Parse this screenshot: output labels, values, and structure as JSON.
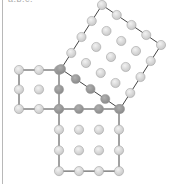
{
  "caption": "a:b:c:",
  "colors": {
    "dot_light": "#c8c8c8",
    "dot_dark": "#8a8a8a",
    "edge": "#444444",
    "dot_stroke": "#999999"
  },
  "diagram": {
    "squares": [
      {
        "name": "small-square",
        "side_dots": 3,
        "origin": [
          19,
          70
        ],
        "u": [
          20,
          0
        ],
        "v": [
          0,
          19.5
        ]
      },
      {
        "name": "medium-square",
        "side_dots": 4,
        "origin": [
          59,
          109
        ],
        "u": [
          20,
          0
        ],
        "v": [
          0,
          20.7
        ]
      },
      {
        "name": "large-square",
        "side_dots": 5,
        "origin": [
          102,
          5
        ],
        "u": [
          14.75,
          10
        ],
        "v": [
          -10.25,
          16
        ]
      }
    ]
  }
}
